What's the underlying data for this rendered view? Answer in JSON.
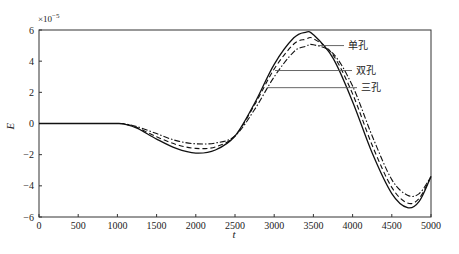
{
  "chart_data": {
    "type": "line",
    "title": "",
    "xlabel": "t",
    "ylabel": "E",
    "y_multiplier": "×10⁻⁵",
    "xlim": [
      0,
      5000
    ],
    "ylim": [
      -6,
      6
    ],
    "xticks": [
      0,
      500,
      1000,
      1500,
      2000,
      2500,
      3000,
      3500,
      4000,
      4500,
      5000
    ],
    "yticks": [
      -6,
      -4,
      -2,
      0,
      2,
      4,
      6
    ],
    "grid": false,
    "legend_position": "annotated leader lines, upper right",
    "x": [
      0,
      500,
      1000,
      1100,
      1250,
      1500,
      1750,
      2000,
      2250,
      2500,
      2750,
      3000,
      3250,
      3400,
      3500,
      3750,
      4000,
      4250,
      4500,
      4700,
      4850,
      5000
    ],
    "series": [
      {
        "name": "单孔",
        "style": "solid",
        "values": [
          0,
          0,
          0,
          -0.05,
          -0.3,
          -1.0,
          -1.6,
          -1.9,
          -1.7,
          -0.8,
          1.3,
          3.8,
          5.5,
          5.85,
          5.7,
          4.2,
          1.4,
          -1.9,
          -4.5,
          -5.4,
          -5.0,
          -3.4
        ]
      },
      {
        "name": "双孔",
        "style": "dashed",
        "values": [
          0,
          0,
          0,
          -0.04,
          -0.25,
          -0.85,
          -1.35,
          -1.6,
          -1.5,
          -0.8,
          1.2,
          3.5,
          5.1,
          5.4,
          5.45,
          4.4,
          1.9,
          -1.4,
          -4.1,
          -5.1,
          -4.8,
          -3.4
        ]
      },
      {
        "name": "三孔",
        "style": "dashdot",
        "values": [
          0,
          0,
          0,
          -0.03,
          -0.2,
          -0.65,
          -1.1,
          -1.3,
          -1.25,
          -0.8,
          0.9,
          3.0,
          4.6,
          4.95,
          5.05,
          4.5,
          2.4,
          -0.8,
          -3.6,
          -4.6,
          -4.5,
          -3.4
        ]
      }
    ],
    "annotations": [
      {
        "text": "单孔",
        "y": 5.0
      },
      {
        "text": "双孔",
        "y": 3.4
      },
      {
        "text": "三孔",
        "y": 2.3
      }
    ]
  }
}
